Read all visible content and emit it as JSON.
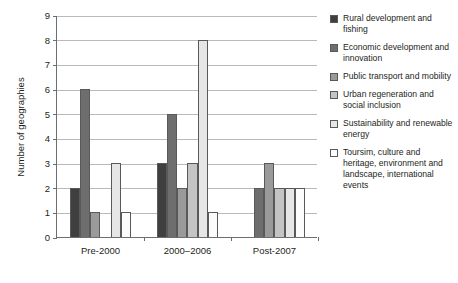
{
  "chart_data": {
    "type": "bar",
    "title": "",
    "subtitle": "",
    "xlabel": "",
    "ylabel": "Number of geographies",
    "ylim": [
      0,
      9
    ],
    "ytick_labels": [
      "0",
      "1",
      "2",
      "3",
      "4",
      "5",
      "6",
      "7",
      "8",
      "9"
    ],
    "ytick_values": [
      0,
      1,
      2,
      3,
      4,
      5,
      6,
      7,
      8,
      9
    ],
    "grid": true,
    "legend_position": "right",
    "categories": [
      "Pre-2000",
      "2000–2006",
      "Post-2007"
    ],
    "series": [
      {
        "name": "Rural development and fishing",
        "color": "#3f3f3f",
        "values": [
          2,
          3,
          0
        ]
      },
      {
        "name": "Economic development and innovation",
        "color": "#6e6e6e",
        "values": [
          6,
          5,
          2
        ]
      },
      {
        "name": "Public transport and mobility",
        "color": "#9a9a9a",
        "values": [
          1,
          2,
          3
        ]
      },
      {
        "name": "Urban regeneration and social inclusion",
        "color": "#c4c4c4",
        "values": [
          0,
          3,
          2
        ]
      },
      {
        "name": "Sustainability and renewable energy",
        "color": "#e6e6e6",
        "values": [
          3,
          8,
          2
        ]
      },
      {
        "name": "Toursim, culture and heritage, environment and landscape, international events",
        "color": "#fcfcfc",
        "values": [
          1,
          1,
          2
        ]
      }
    ]
  },
  "legend": {
    "items": [
      {
        "label": "Rural development and fishing",
        "swatch": "#3f3f3f"
      },
      {
        "label": "Economic development and innovation",
        "swatch": "#6e6e6e"
      },
      {
        "label": "Public transport and mobility",
        "swatch": "#9a9a9a"
      },
      {
        "label": "Urban regeneration and social inclusion",
        "swatch": "#c4c4c4"
      },
      {
        "label": "Sustainability and renewable energy",
        "swatch": "#e6e6e6"
      },
      {
        "label": "Toursim, culture and heritage, environment and landscape, international events",
        "swatch": "#fcfcfc"
      }
    ]
  }
}
